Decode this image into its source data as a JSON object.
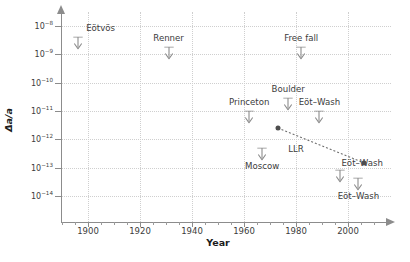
{
  "chart_data": {
    "type": "scatter",
    "title": "",
    "xlabel": "Year",
    "ylabel": "Δa/a",
    "xlim": [
      1888,
      2014
    ],
    "ylim_exponents": [
      -14.6,
      -7.7
    ],
    "grid": "dotted",
    "legend": "none",
    "y_tick_labels": [
      "10⁻⁸",
      "10⁻⁹",
      "10⁻¹⁰",
      "10⁻¹¹",
      "10⁻¹²",
      "10⁻¹³",
      "10⁻¹⁴"
    ],
    "y_tick_mantissas": [
      "10",
      "10",
      "10",
      "10",
      "10",
      "10",
      "10"
    ],
    "y_tick_exponents": [
      "-8",
      "-9",
      "-10",
      "-11",
      "-12",
      "-13",
      "-14"
    ],
    "y_tick_values": [
      1e-08,
      1e-09,
      1e-10,
      1e-11,
      1e-12,
      1e-13,
      1e-14
    ],
    "x_tick_labels": [
      "1900",
      "1920",
      "1940",
      "1960",
      "1980",
      "2000"
    ],
    "x_tick_values": [
      1900,
      1920,
      1940,
      1960,
      1980,
      2000
    ],
    "x_minor_ticks": [
      1890,
      1895,
      1905,
      1910,
      1915,
      1925,
      1930,
      1935,
      1945,
      1950,
      1955,
      1965,
      1970,
      1975,
      1985,
      1990,
      1995,
      2005,
      2010
    ],
    "marker_color": "#4d4d4d",
    "grid_color": "#cfcfcf",
    "axis_color": "#8c8c8c",
    "upper_limits": [
      {
        "name": "Eötvös",
        "year": 1896,
        "value": 3e-09,
        "label_pos": "above-right"
      },
      {
        "name": "Renner",
        "year": 1931,
        "value": 1.3e-09,
        "label_pos": "above"
      },
      {
        "name": "Free fall",
        "year": 1982,
        "value": 1.3e-09,
        "label_pos": "above"
      },
      {
        "name": "Boulder",
        "year": 1977,
        "value": 2e-11,
        "label_pos": "above"
      },
      {
        "name": "Princetons",
        "display": "Princeton",
        "year": 1962,
        "value": 7e-12,
        "label_pos": "above"
      },
      {
        "name": "Eöt–Wash A",
        "display": "Eöt–Wash",
        "year": 1989,
        "value": 7e-12,
        "label_pos": "above"
      },
      {
        "name": "Moscow",
        "year": 1967,
        "value": 3.5e-13,
        "label_pos": "below"
      },
      {
        "name": "Eöt–Wash B",
        "display": "Eöt–Wash",
        "year": 1997,
        "value": 6e-14,
        "label_pos": "above-left"
      },
      {
        "name": "Eöt–Wash C",
        "display": "Eöt–Wash",
        "year": 2004,
        "value": 3e-14,
        "label_pos": "below"
      }
    ],
    "series": [
      {
        "name": "LLR",
        "style": "dotted-line-with-dots",
        "label": "LLR",
        "label_year": 1980,
        "label_value": 4.5e-13,
        "points": [
          {
            "year": 1973,
            "value": 2.5e-12
          },
          {
            "year": 2006,
            "value": 1.5e-13
          }
        ]
      }
    ]
  },
  "axis_titles": {
    "x": "Year",
    "y_delta": "Δa/a"
  }
}
